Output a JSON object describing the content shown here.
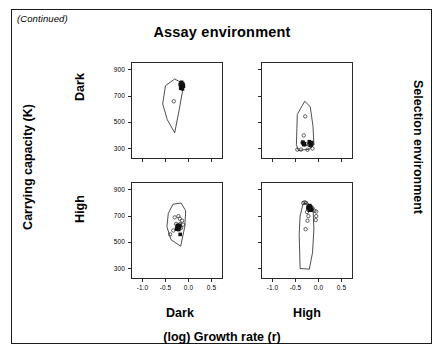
{
  "figure": {
    "continued_note": "(Continued)",
    "top_title": "Assay environment",
    "left_axis_title": "Carrying capacity (K)",
    "right_axis_title": "Selection environment",
    "bottom_axis_title": "(log) Growth rate (r)",
    "row_labels": [
      "Dark",
      "High"
    ],
    "column_labels": [
      "Dark",
      "High"
    ]
  },
  "chart_data": {
    "type": "scatter",
    "title": "Assay environment",
    "xlabel": "(log) Growth rate (r)",
    "ylabel": "Carrying capacity (K)",
    "xlim": [
      -1.25,
      0.75
    ],
    "ylim": [
      220,
      960
    ],
    "xticks": [
      -1.0,
      -0.5,
      0.0,
      0.5
    ],
    "xticklabels": [
      "-1.0",
      "-0.5",
      "0.0",
      "0.5"
    ],
    "yticks": [
      300,
      500,
      700,
      900
    ],
    "yticklabels": [
      "300",
      "500",
      "700",
      "900"
    ],
    "grid": false,
    "legend": "none",
    "layout": "2x2 panel grid; rows = Selection environment (Dark, High); columns = Assay environment (Dark, High)",
    "marker_styles": {
      "open_circle": "ancestral / individual replicate lines",
      "filled_square": "evolved replicate lines"
    },
    "panels": [
      {
        "row": 0,
        "col": 0,
        "selection_environment": "Dark",
        "assay_environment": "Dark",
        "hull": [
          [
            -0.5,
            780
          ],
          [
            -0.3,
            830
          ],
          [
            -0.14,
            800
          ],
          [
            -0.12,
            760
          ],
          [
            -0.2,
            600
          ],
          [
            -0.3,
            420
          ],
          [
            -0.46,
            520
          ],
          [
            -0.56,
            640
          ]
        ],
        "open_points": [
          [
            -0.32,
            660
          ]
        ],
        "filled_points": [
          [
            -0.16,
            800
          ],
          [
            -0.14,
            795
          ],
          [
            -0.15,
            785
          ],
          [
            -0.13,
            780
          ],
          [
            -0.16,
            772
          ],
          [
            -0.14,
            765
          ],
          [
            -0.12,
            790
          ],
          [
            -0.17,
            760
          ],
          [
            -0.11,
            775
          ],
          [
            -0.15,
            805
          ],
          [
            -0.13,
            755
          ],
          [
            -0.18,
            788
          ]
        ]
      },
      {
        "row": 0,
        "col": 1,
        "selection_environment": "Dark",
        "assay_environment": "High",
        "hull": [
          [
            -0.3,
            660
          ],
          [
            -0.18,
            620
          ],
          [
            -0.12,
            470
          ],
          [
            -0.1,
            330
          ],
          [
            -0.2,
            295
          ],
          [
            -0.44,
            285
          ],
          [
            -0.48,
            330
          ],
          [
            -0.46,
            560
          ]
        ],
        "open_points": [
          [
            -0.29,
            545
          ],
          [
            -0.32,
            400
          ],
          [
            -0.35,
            345
          ],
          [
            -0.3,
            330
          ],
          [
            -0.27,
            335
          ],
          [
            -0.21,
            330
          ],
          [
            -0.17,
            320
          ],
          [
            -0.14,
            335
          ],
          [
            -0.46,
            292
          ],
          [
            -0.38,
            292
          ],
          [
            -0.24,
            290
          ],
          [
            -0.13,
            300
          ]
        ],
        "filled_points": [
          [
            -0.33,
            340
          ],
          [
            -0.32,
            330
          ],
          [
            -0.34,
            348
          ],
          [
            -0.31,
            336
          ],
          [
            -0.19,
            345
          ],
          [
            -0.17,
            338
          ],
          [
            -0.2,
            352
          ],
          [
            -0.16,
            330
          ],
          [
            -0.18,
            326
          ],
          [
            -0.15,
            345
          ]
        ]
      },
      {
        "row": 1,
        "col": 0,
        "selection_environment": "High",
        "assay_environment": "Dark",
        "hull": [
          [
            -0.34,
            790
          ],
          [
            -0.16,
            800
          ],
          [
            -0.06,
            740
          ],
          [
            -0.08,
            620
          ],
          [
            -0.17,
            470
          ],
          [
            -0.38,
            520
          ],
          [
            -0.47,
            620
          ],
          [
            -0.44,
            720
          ]
        ],
        "open_points": [
          [
            -0.3,
            690
          ],
          [
            -0.22,
            700
          ],
          [
            -0.19,
            680
          ],
          [
            -0.14,
            665
          ],
          [
            -0.27,
            640
          ],
          [
            -0.18,
            640
          ],
          [
            -0.12,
            635
          ],
          [
            -0.33,
            590
          ],
          [
            -0.4,
            560
          ],
          [
            -0.24,
            600
          ],
          [
            -0.16,
            610
          ]
        ],
        "filled_points": [
          [
            -0.24,
            628
          ],
          [
            -0.22,
            620
          ],
          [
            -0.21,
            612
          ],
          [
            -0.23,
            605
          ],
          [
            -0.2,
            630
          ],
          [
            -0.19,
            618
          ],
          [
            -0.25,
            615
          ],
          [
            -0.26,
            600
          ],
          [
            -0.21,
            598
          ],
          [
            -0.18,
            560
          ]
        ]
      },
      {
        "row": 1,
        "col": 1,
        "selection_environment": "High",
        "assay_environment": "High",
        "hull": [
          [
            -0.34,
            790
          ],
          [
            -0.24,
            800
          ],
          [
            -0.12,
            760
          ],
          [
            -0.1,
            600
          ],
          [
            -0.13,
            420
          ],
          [
            -0.2,
            295
          ],
          [
            -0.4,
            300
          ],
          [
            -0.42,
            560
          ],
          [
            -0.4,
            700
          ]
        ],
        "open_points": [
          [
            -0.33,
            800
          ],
          [
            -0.3,
            805
          ],
          [
            -0.27,
            800
          ],
          [
            -0.13,
            760
          ],
          [
            -0.09,
            740
          ],
          [
            -0.05,
            735
          ],
          [
            -0.05,
            700
          ],
          [
            -0.06,
            670
          ],
          [
            -0.25,
            730
          ],
          [
            -0.22,
            700
          ],
          [
            -0.24,
            665
          ],
          [
            -0.28,
            600
          ]
        ],
        "filled_points": [
          [
            -0.22,
            775
          ],
          [
            -0.2,
            768
          ],
          [
            -0.19,
            780
          ],
          [
            -0.21,
            760
          ],
          [
            -0.18,
            755
          ],
          [
            -0.17,
            770
          ],
          [
            -0.23,
            762
          ],
          [
            -0.16,
            745
          ],
          [
            -0.2,
            745
          ],
          [
            -0.15,
            752
          ]
        ]
      }
    ]
  }
}
